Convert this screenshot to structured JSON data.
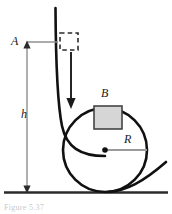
{
  "figure": {
    "caption": "Figure  5.37",
    "labels": {
      "point_A": "A",
      "height_h": "h",
      "block_B": "B",
      "radius_R": "R"
    },
    "colors": {
      "ink": "#1a1a1a",
      "track": "#111111",
      "block_fill": "#d6d6d6",
      "block_stroke": "#3a3a3a",
      "dimension_gray": "#8f8f8f",
      "ground": "#2b2b2b",
      "background": "#ffffff",
      "caption_gray": "#c9c9c9"
    },
    "geometry": {
      "ground_y": 192,
      "loop_center_x": 105,
      "loop_center_y": 150,
      "loop_radius": 42,
      "drop_top_y": 8,
      "release_level_y": 42,
      "h_arrow_x": 27,
      "radius_line_end_x": 147,
      "dashed_box": {
        "x": 60,
        "y": 33,
        "w": 18,
        "h": 17
      },
      "block_box": {
        "x": 94,
        "y": 106,
        "w": 28,
        "h": 23
      },
      "motion_arrow": {
        "x": 71,
        "y_top": 52,
        "y_bottom": 108
      }
    }
  }
}
